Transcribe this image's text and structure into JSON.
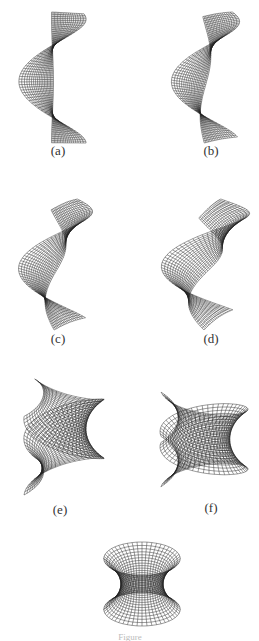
{
  "figure": {
    "panels": [
      {
        "id": "a",
        "label": "(a)",
        "surface": "helicoid",
        "t": 0.0
      },
      {
        "id": "b",
        "label": "(b)",
        "surface": "helicoid-catenoid deformation",
        "t": 0.17
      },
      {
        "id": "c",
        "label": "(c)",
        "surface": "helicoid-catenoid deformation",
        "t": 0.33
      },
      {
        "id": "d",
        "label": "(d)",
        "surface": "helicoid-catenoid deformation",
        "t": 0.5
      },
      {
        "id": "e",
        "label": "(e)",
        "surface": "helicoid-catenoid deformation",
        "t": 0.67
      },
      {
        "id": "f",
        "label": "(f)",
        "surface": "helicoid-catenoid deformation",
        "t": 0.83
      },
      {
        "id": "g",
        "label": "",
        "surface": "catenoid",
        "t": 1.0
      }
    ],
    "caption_clipped": "Figure"
  },
  "colors": {
    "background": "#ffffff",
    "mesh_line": "#222222",
    "label_text": "#333333"
  }
}
